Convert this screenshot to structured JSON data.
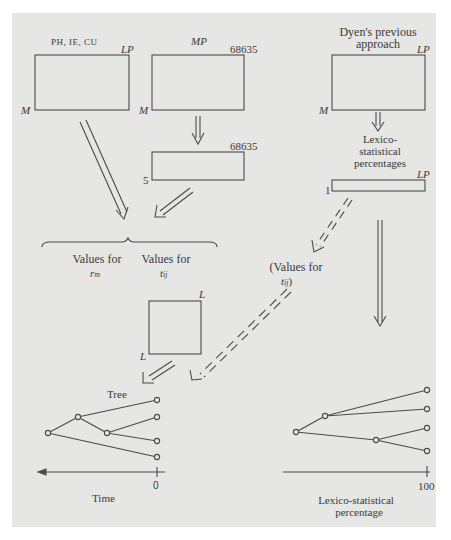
{
  "diagram": {
    "left_panel": {
      "matrix1": {
        "title": "PH, IE, CU",
        "top_right": "LP",
        "bottom_left": "M"
      },
      "matrix2": {
        "title": "MP",
        "top_right": "68635",
        "bottom_left": "M"
      },
      "matrix3": {
        "top_right": "68635",
        "bottom_left": "5"
      },
      "values_rm": {
        "line1": "Values for",
        "line2": "r",
        "sub": "m"
      },
      "values_tij": {
        "line1": "Values for",
        "line2": "t",
        "sub": "ij"
      },
      "square": {
        "top_right": "L",
        "bottom_left": "L"
      },
      "tree": {
        "title": "Tree",
        "axis_label": "Time",
        "axis_tick": "0",
        "nodes": [
          {
            "id": "root",
            "x": 48,
            "y": 433
          },
          {
            "id": "n1",
            "x": 78,
            "y": 417
          },
          {
            "id": "n2",
            "x": 107,
            "y": 433
          },
          {
            "id": "l1",
            "x": 157,
            "y": 400
          },
          {
            "id": "l2",
            "x": 157,
            "y": 417
          },
          {
            "id": "l3",
            "x": 157,
            "y": 441
          },
          {
            "id": "l4",
            "x": 157,
            "y": 457
          }
        ],
        "edges": [
          [
            "root",
            "n1"
          ],
          [
            "root",
            "l4"
          ],
          [
            "n1",
            "l1"
          ],
          [
            "n1",
            "n2"
          ],
          [
            "n2",
            "l2"
          ],
          [
            "n2",
            "l3"
          ]
        ]
      }
    },
    "right_panel": {
      "title_line1": "Dyen's previous",
      "title_line2": "approach",
      "matrix": {
        "top_right": "LP",
        "bottom_left": "M"
      },
      "lexico_label": [
        "Lexico-",
        "statistical",
        "percentages"
      ],
      "strip": {
        "top_right": "LP",
        "bottom_left": "1"
      },
      "values_tij_paren": {
        "line1": "(Values for",
        "line2": "t",
        "sub": "ij",
        "close": ")"
      },
      "tree": {
        "axis_label_line1": "Lexico-statistical",
        "axis_label_line2": "percentage",
        "axis_tick": "100",
        "nodes": [
          {
            "id": "root",
            "x": 296,
            "y": 432
          },
          {
            "id": "n1",
            "x": 325,
            "y": 416
          },
          {
            "id": "n2",
            "x": 376,
            "y": 440
          },
          {
            "id": "l1",
            "x": 427,
            "y": 390
          },
          {
            "id": "l2",
            "x": 427,
            "y": 409
          },
          {
            "id": "l3",
            "x": 427,
            "y": 428
          },
          {
            "id": "l4",
            "x": 427,
            "y": 451
          }
        ],
        "edges": [
          [
            "root",
            "n1"
          ],
          [
            "root",
            "n2"
          ],
          [
            "n1",
            "l1"
          ],
          [
            "n1",
            "l2"
          ],
          [
            "n2",
            "l3"
          ],
          [
            "n2",
            "l4"
          ]
        ]
      }
    },
    "colors": {
      "page": "#e6e6e4",
      "ink": "#4a4a4a"
    }
  }
}
